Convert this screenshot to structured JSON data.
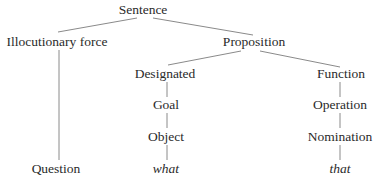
{
  "diagram": {
    "type": "tree",
    "line_color": "#8a8a8a",
    "text_color": "#2a2a2a",
    "nodes": [
      {
        "id": "sentence",
        "label": "Sentence",
        "x": 143,
        "y": 10,
        "italic": false
      },
      {
        "id": "illocutionary_force",
        "label": "Illocutionary force",
        "x": 57,
        "y": 42,
        "italic": false
      },
      {
        "id": "proposition",
        "label": "Proposition",
        "x": 254,
        "y": 42,
        "italic": false
      },
      {
        "id": "designated",
        "label": "Designated",
        "x": 165,
        "y": 74,
        "italic": false
      },
      {
        "id": "function",
        "label": "Function",
        "x": 341,
        "y": 74,
        "italic": false
      },
      {
        "id": "goal",
        "label": "Goal",
        "x": 166,
        "y": 105,
        "italic": false
      },
      {
        "id": "operation",
        "label": "Operation",
        "x": 340,
        "y": 105,
        "italic": false
      },
      {
        "id": "object",
        "label": "Object",
        "x": 166,
        "y": 137,
        "italic": false
      },
      {
        "id": "nomination",
        "label": "Nomination",
        "x": 340,
        "y": 137,
        "italic": false
      },
      {
        "id": "question",
        "label": "Question",
        "x": 56,
        "y": 169,
        "italic": false
      },
      {
        "id": "what",
        "label": "what",
        "x": 166,
        "y": 169,
        "italic": true
      },
      {
        "id": "that",
        "label": "that",
        "x": 340,
        "y": 169,
        "italic": true
      }
    ],
    "edges": [
      {
        "from": "sentence",
        "to": "illocutionary_force",
        "x1": 137,
        "y1": 18,
        "x2": 58,
        "y2": 32
      },
      {
        "from": "sentence",
        "to": "proposition",
        "x1": 153,
        "y1": 18,
        "x2": 253,
        "y2": 35
      },
      {
        "from": "illocutionary_force",
        "to": "question",
        "x1": 59,
        "y1": 50,
        "x2": 59,
        "y2": 160
      },
      {
        "from": "proposition",
        "to": "designated",
        "x1": 241,
        "y1": 51,
        "x2": 168,
        "y2": 65
      },
      {
        "from": "proposition",
        "to": "function",
        "x1": 260,
        "y1": 51,
        "x2": 340,
        "y2": 67
      },
      {
        "from": "designated",
        "to": "goal",
        "x1": 167,
        "y1": 82,
        "x2": 167,
        "y2": 97
      },
      {
        "from": "goal",
        "to": "object",
        "x1": 167,
        "y1": 113,
        "x2": 167,
        "y2": 128
      },
      {
        "from": "object",
        "to": "what",
        "x1": 167,
        "y1": 145,
        "x2": 167,
        "y2": 160
      },
      {
        "from": "function",
        "to": "operation",
        "x1": 340,
        "y1": 82,
        "x2": 340,
        "y2": 97
      },
      {
        "from": "operation",
        "to": "nomination",
        "x1": 340,
        "y1": 113,
        "x2": 340,
        "y2": 128
      },
      {
        "from": "nomination",
        "to": "that",
        "x1": 340,
        "y1": 145,
        "x2": 340,
        "y2": 160
      }
    ]
  }
}
